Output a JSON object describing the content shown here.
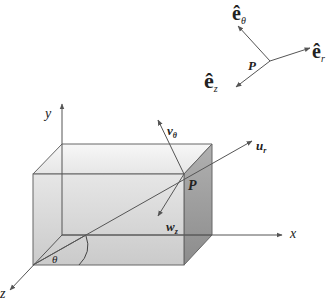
{
  "figure": {
    "type": "3d-coordinate-diagram",
    "colors": {
      "line": "#555555",
      "box_front": "#d4d4d4",
      "box_top": "#ececec",
      "box_side": "#9a9a9a",
      "text": "#222222"
    }
  },
  "axes": {
    "x_label": "x",
    "y_label": "y",
    "z_label": "z"
  },
  "main": {
    "point_label": "P",
    "angle_label": "θ",
    "vectors": {
      "u_r": {
        "base": "u",
        "sub": "r"
      },
      "v_theta": {
        "base": "v",
        "sub": "θ"
      },
      "w_z": {
        "base": "w",
        "sub": "z"
      }
    }
  },
  "inset": {
    "point_label": "P",
    "unit_vectors": {
      "e_r": {
        "base": "ê",
        "sub": "r"
      },
      "e_theta": {
        "base": "ê",
        "sub": "θ"
      },
      "e_z": {
        "base": "ê",
        "sub": "z"
      }
    }
  }
}
